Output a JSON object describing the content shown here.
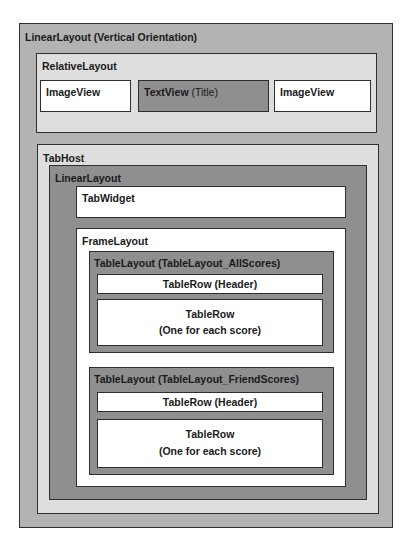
{
  "diagram": {
    "root": {
      "label": "LinearLayout (Vertical Orientation)",
      "relative_layout": {
        "label": "RelativeLayout",
        "left_image": "ImageView",
        "text_view": {
          "name": "TextView",
          "suffix": "(Title)"
        },
        "right_image": "ImageView"
      },
      "tab_host": {
        "label": "TabHost",
        "linear_layout": {
          "label": "LinearLayout",
          "tab_widget": "TabWidget",
          "frame_layout": {
            "label": "FrameLayout",
            "tables": [
              {
                "label": "TableLayout (TableLayout_AllScores)",
                "header_row": "TableRow (Header)",
                "body_row_line1": "TableRow",
                "body_row_line2": "(One for each score)"
              },
              {
                "label": "TableLayout (TableLayout_FriendScores)",
                "header_row": "TableRow (Header)",
                "body_row_line1": "TableRow",
                "body_row_line2": "(One for each score)"
              }
            ]
          }
        }
      }
    },
    "colors": {
      "mid_gray": "#b3b3b3",
      "light_gray": "#dedede",
      "dark_gray": "#8f8f8f",
      "white": "#ffffff",
      "border": "#2e2e2e"
    }
  }
}
